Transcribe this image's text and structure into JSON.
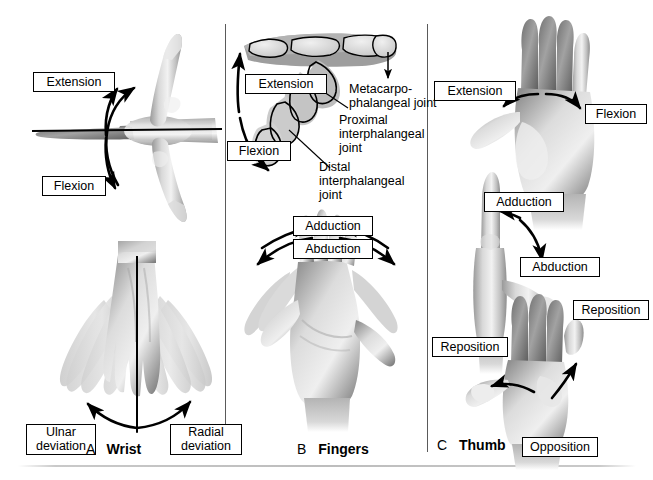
{
  "figure": {
    "background": "#ffffff",
    "rule_color": "#bdbdbd",
    "divider_color": "#5a5a5a"
  },
  "panels": [
    {
      "letter": "A",
      "name": "Wrist",
      "labels": [
        {
          "id": "a-extension",
          "text": "Extension"
        },
        {
          "id": "a-flexion",
          "text": "Flexion"
        },
        {
          "id": "a-ulnar-deviation",
          "text": "Ulnar deviation"
        },
        {
          "id": "a-radial-deviation",
          "text": "Radial deviation"
        }
      ],
      "movements": [
        "Extension",
        "Flexion",
        "Ulnar deviation",
        "Radial deviation"
      ]
    },
    {
      "letter": "B",
      "name": "Fingers",
      "labels": [
        {
          "id": "b-extension",
          "text": "Extension"
        },
        {
          "id": "b-flexion",
          "text": "Flexion"
        },
        {
          "id": "b-adduction",
          "text": "Adduction"
        },
        {
          "id": "b-abduction",
          "text": "Abduction"
        }
      ],
      "annotations": [
        {
          "id": "b-mcp",
          "text": "Metacarpo-phalangeal joint"
        },
        {
          "id": "b-pip",
          "text": "Proximal interphalangeal joint"
        },
        {
          "id": "b-dip",
          "text": "Distal interphalangeal joint"
        }
      ],
      "movements": [
        "Extension",
        "Flexion",
        "Adduction",
        "Abduction"
      ]
    },
    {
      "letter": "C",
      "name": "Thumb",
      "labels": [
        {
          "id": "c-extension",
          "text": "Extension"
        },
        {
          "id": "c-flexion",
          "text": "Flexion"
        },
        {
          "id": "c-adduction",
          "text": "Adduction"
        },
        {
          "id": "c-abduction",
          "text": "Abduction"
        },
        {
          "id": "c-reposition-1",
          "text": "Reposition"
        },
        {
          "id": "c-reposition-2",
          "text": "Reposition"
        },
        {
          "id": "c-opposition",
          "text": "Opposition"
        }
      ],
      "movements": [
        "Extension",
        "Flexion",
        "Adduction",
        "Abduction",
        "Reposition",
        "Opposition"
      ]
    }
  ],
  "annotation_lines": {
    "mcp_line1": "Metacarpo-",
    "mcp_line2": "phalangeal joint",
    "pip_line1": "Proximal",
    "pip_line2": "interphalangeal",
    "pip_line3": "joint",
    "dip_line1": "Distal",
    "dip_line2": "interphalangeal",
    "dip_line3": "joint"
  },
  "deviation_lines": {
    "ulnar_line1": "Ulnar",
    "ulnar_line2": "deviation",
    "radial_line1": "Radial",
    "radial_line2": "deviation"
  },
  "captions": {
    "a_letter": "A",
    "a_word": "Wrist",
    "b_letter": "B",
    "b_word": "Fingers",
    "c_letter": "C",
    "c_word": "Thumb"
  }
}
